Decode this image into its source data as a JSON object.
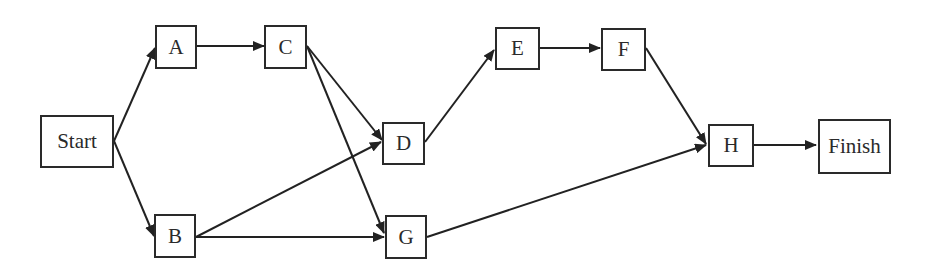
{
  "diagram": {
    "type": "network-flow (activity-on-node)",
    "nodes": [
      {
        "id": "start",
        "label": "Start",
        "x": 40,
        "y": 115,
        "w": 74,
        "h": 53
      },
      {
        "id": "A",
        "label": "A",
        "x": 155,
        "y": 25,
        "w": 42,
        "h": 44
      },
      {
        "id": "B",
        "label": "B",
        "x": 154,
        "y": 214,
        "w": 42,
        "h": 44
      },
      {
        "id": "C",
        "label": "C",
        "x": 264,
        "y": 25,
        "w": 43,
        "h": 44
      },
      {
        "id": "D",
        "label": "D",
        "x": 382,
        "y": 122,
        "w": 43,
        "h": 43
      },
      {
        "id": "G",
        "label": "G",
        "x": 385,
        "y": 215,
        "w": 42,
        "h": 44
      },
      {
        "id": "E",
        "label": "E",
        "x": 495,
        "y": 27,
        "w": 45,
        "h": 43
      },
      {
        "id": "F",
        "label": "F",
        "x": 601,
        "y": 28,
        "w": 45,
        "h": 43
      },
      {
        "id": "H",
        "label": "H",
        "x": 708,
        "y": 124,
        "w": 46,
        "h": 43
      },
      {
        "id": "finish",
        "label": "Finish",
        "x": 818,
        "y": 119,
        "w": 73,
        "h": 55
      }
    ],
    "edges": [
      {
        "from": "start",
        "to": "A"
      },
      {
        "from": "start",
        "to": "B"
      },
      {
        "from": "A",
        "to": "C"
      },
      {
        "from": "C",
        "to": "D"
      },
      {
        "from": "C",
        "to": "G"
      },
      {
        "from": "B",
        "to": "D"
      },
      {
        "from": "B",
        "to": "G"
      },
      {
        "from": "D",
        "to": "E"
      },
      {
        "from": "E",
        "to": "F"
      },
      {
        "from": "F",
        "to": "H"
      },
      {
        "from": "G",
        "to": "H"
      },
      {
        "from": "H",
        "to": "finish"
      }
    ]
  }
}
